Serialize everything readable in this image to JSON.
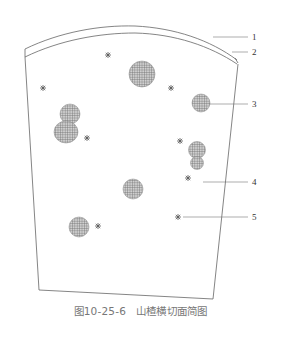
{
  "figure": {
    "caption_number": "图10-25-6",
    "caption_title": "山楂横切面简图",
    "line_color": "#666666",
    "fill_color": "#999999",
    "callouts": [
      {
        "id": "1",
        "label": "1"
      },
      {
        "id": "2",
        "label": "2"
      },
      {
        "id": "3",
        "label": "3"
      },
      {
        "id": "4",
        "label": "4"
      },
      {
        "id": "5",
        "label": "5"
      }
    ]
  }
}
